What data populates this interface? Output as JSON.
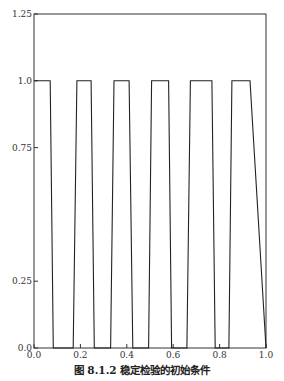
{
  "chart_data": {
    "type": "line",
    "title": "",
    "caption": "图 8.1.2   稳定检验的初始条件",
    "xlabel": "",
    "ylabel": "",
    "xlim": [
      0.0,
      1.0
    ],
    "ylim": [
      0.0,
      1.25
    ],
    "xticks": [
      "0.0",
      "0.2",
      "0.4",
      "0.6",
      "0.8",
      "1.0"
    ],
    "yticks": [
      "0.0",
      "0.25",
      "0.75",
      "1.0",
      "1.25"
    ],
    "grid": false,
    "legend": null,
    "series": [
      {
        "name": "initial condition",
        "x": [
          0.0,
          0.07,
          0.083,
          0.169,
          0.185,
          0.246,
          0.26,
          0.33,
          0.345,
          0.41,
          0.426,
          0.494,
          0.507,
          0.58,
          0.593,
          0.659,
          0.674,
          0.767,
          0.781,
          0.84,
          0.853,
          0.931,
          1.0
        ],
        "y": [
          1.0,
          1.0,
          0.0,
          0.0,
          1.0,
          1.0,
          0.0,
          0.0,
          1.0,
          1.0,
          0.0,
          0.0,
          1.0,
          1.0,
          0.0,
          0.0,
          1.0,
          1.0,
          0.0,
          0.0,
          1.0,
          1.0,
          0.0
        ]
      }
    ]
  },
  "caption": "图 8.1.2   稳定检验的初始条件"
}
